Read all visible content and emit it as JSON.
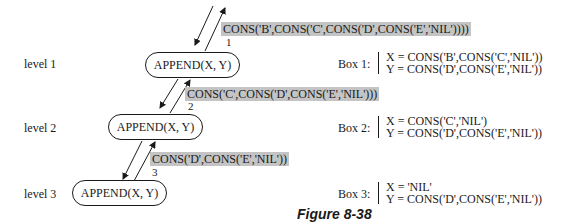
{
  "levels": [
    {
      "label": "level 1",
      "node": "APPEND(X, Y)",
      "box_label": "Box 1:",
      "x_binding": "X = CONS('B',CONS('C','NIL'))",
      "y_binding": "Y = CONS('D',CONS('E','NIL'))",
      "return_value": "CONS('B',CONS('C',CONS('D',CONS('E','NIL'))))",
      "return_step": "1"
    },
    {
      "label": "level 2",
      "node": "APPEND(X, Y)",
      "box_label": "Box 2:",
      "x_binding": "X = CONS('C','NIL')",
      "y_binding": "Y = CONS('D',CONS('E','NIL'))",
      "return_value": "CONS('C',CONS('D',CONS('E','NIL')))",
      "return_step": "2"
    },
    {
      "label": "level 3",
      "node": "APPEND(X, Y)",
      "box_label": "Box 3:",
      "x_binding": "X = 'NIL'",
      "y_binding": "Y = CONS('D',CONS('E','NIL'))",
      "return_value": "CONS('D',CONS('E','NIL'))",
      "return_step": "3"
    }
  ],
  "caption": "Figure 8-38",
  "colors": {
    "highlight": "#c4c4c4",
    "ink": "#1a1a1a"
  }
}
